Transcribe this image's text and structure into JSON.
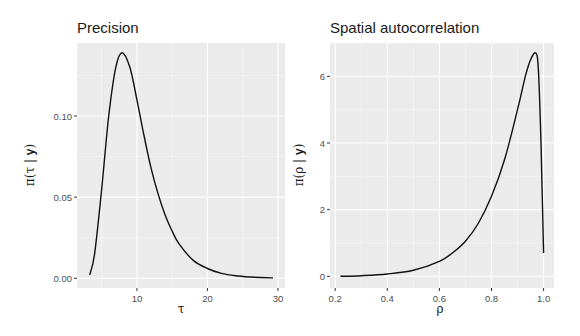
{
  "chart_data": [
    {
      "type": "line",
      "title": "Precision",
      "xlabel": "τ",
      "ylabel": "π(τ | y)",
      "xticks": [
        10,
        20,
        30
      ],
      "yticks": [
        0.0,
        0.05,
        0.1
      ],
      "ytick_labels": [
        "0.00",
        "0.05",
        "0.10"
      ],
      "xlim": [
        1.5,
        31
      ],
      "ylim": [
        -0.006,
        0.145
      ],
      "grid": true,
      "x": [
        3.3,
        4,
        5,
        6,
        7,
        7.9,
        9,
        10,
        11,
        12,
        13,
        14,
        15,
        16,
        18,
        20,
        22,
        24,
        26,
        29.3
      ],
      "y": [
        0.002,
        0.015,
        0.055,
        0.1,
        0.13,
        0.139,
        0.13,
        0.11,
        0.088,
        0.068,
        0.052,
        0.039,
        0.029,
        0.021,
        0.011,
        0.006,
        0.003,
        0.0015,
        0.0008,
        0.0002
      ]
    },
    {
      "type": "line",
      "title": "Spatial autocorrelation",
      "xlabel": "ρ",
      "ylabel": "π(ρ | y)",
      "xticks": [
        0.2,
        0.4,
        0.6,
        0.8,
        1.0
      ],
      "xtick_labels": [
        "0.2",
        "0.4",
        "0.6",
        "0.8",
        "1.0"
      ],
      "yticks": [
        0,
        2,
        4,
        6
      ],
      "ytick_labels": [
        "0",
        "2",
        "4",
        "6"
      ],
      "xlim": [
        0.18,
        1.04
      ],
      "ylim": [
        -0.35,
        7.0
      ],
      "grid": true,
      "x": [
        0.22,
        0.3,
        0.4,
        0.5,
        0.6,
        0.65,
        0.7,
        0.75,
        0.8,
        0.85,
        0.9,
        0.93,
        0.95,
        0.97,
        0.98,
        0.99,
        1.0
      ],
      "y": [
        0.0,
        0.02,
        0.07,
        0.18,
        0.45,
        0.7,
        1.05,
        1.6,
        2.4,
        3.5,
        5.0,
        6.0,
        6.5,
        6.7,
        6.2,
        4.0,
        0.7
      ]
    }
  ]
}
